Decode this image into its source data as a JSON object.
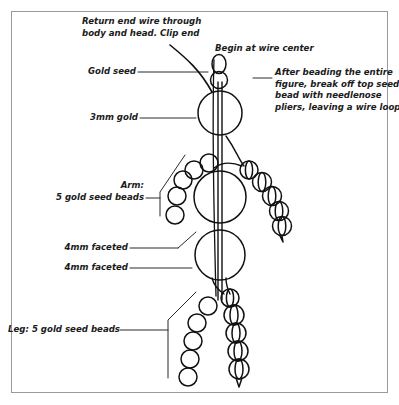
{
  "figure": {
    "border_color": "#9a9a9a",
    "ink_color": "#111111",
    "background": "#ffffff"
  },
  "annotations": {
    "return_end_wire": "Return end wire through\nbody and head. Clip end",
    "begin_at_center": "Begin at wire center",
    "gold_seed": "Gold seed",
    "three_mm_gold": "3mm gold",
    "break_off_note": "After beading the entire\nfigure, break off top seed\nbead with needlenose\npliers, leaving a wire loop.",
    "arm_label": "Arm:\n5 gold seed beads",
    "four_mm_faceted_upper": "4mm faceted",
    "four_mm_faceted_lower": "4mm faceted",
    "leg_label": "Leg: 5 gold seed beads"
  },
  "parts": {
    "top_seed_bead": "seed bead wire loop",
    "gold_seed_bead": "gold seed bead",
    "head_bead": "3mm gold bead",
    "chest_bead": "4mm faceted bead",
    "hip_bead": "4mm faceted bead",
    "arm_bead_count": 5,
    "leg_bead_count": 5,
    "arm_callout_bead_count": 5,
    "leg_callout_bead_count": 5
  }
}
